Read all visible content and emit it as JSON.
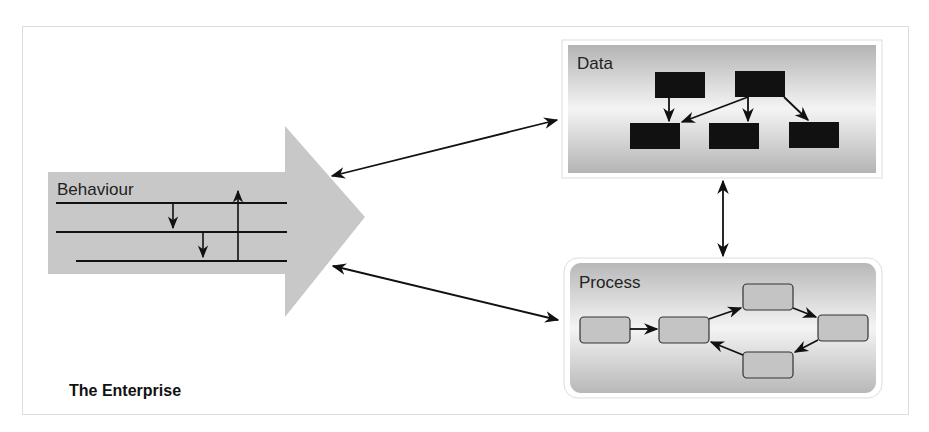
{
  "diagram": {
    "title": "The Enterprise",
    "nodes": {
      "behaviour": {
        "label": "Behaviour",
        "shape": "block-arrow",
        "fill": "#c8c8c8"
      },
      "data": {
        "label": "Data",
        "shape": "rectangle-gradient",
        "child_fill": "#111111",
        "child_count": 5
      },
      "process": {
        "label": "Process",
        "shape": "rounded-rectangle-gradient",
        "child_fill": "#c4c4c4",
        "child_count": 5
      }
    },
    "edges": [
      {
        "from": "behaviour",
        "to": "data",
        "direction": "bidirectional"
      },
      {
        "from": "behaviour",
        "to": "process",
        "direction": "bidirectional"
      },
      {
        "from": "data",
        "to": "process",
        "direction": "bidirectional"
      }
    ],
    "colors": {
      "line": "#111111",
      "panel_dark": "#b0b0b0",
      "panel_light": "#f2f2f2"
    }
  }
}
